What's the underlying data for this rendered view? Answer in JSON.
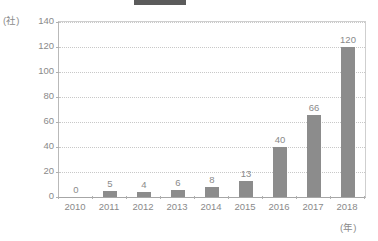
{
  "legend": {
    "series_label": "",
    "note": ""
  },
  "chart_data": {
    "type": "bar",
    "title": "",
    "xlabel": "(年)",
    "ylabel": "(社)",
    "categories": [
      "2010",
      "2011",
      "2012",
      "2013",
      "2014",
      "2015",
      "2016",
      "2017",
      "2018"
    ],
    "values": [
      0,
      5,
      4,
      6,
      8,
      13,
      40,
      66,
      120
    ],
    "value_labels": [
      "0",
      "5",
      "4",
      "6",
      "8",
      "13",
      "40",
      "66",
      "120"
    ],
    "ylim": [
      0,
      140
    ],
    "yticks": [
      0,
      20,
      40,
      60,
      80,
      100,
      120,
      140
    ],
    "ytick_labels": [
      "0",
      "20",
      "40",
      "60",
      "80",
      "100",
      "120",
      "140"
    ],
    "grid": true,
    "legend_position": "top",
    "bar_color": "#8c8c8c",
    "grid_color": "#c8c8c8",
    "axis_color": "#a6a6a6",
    "text_color": "#8a8a8a",
    "background": "#ffffff"
  }
}
